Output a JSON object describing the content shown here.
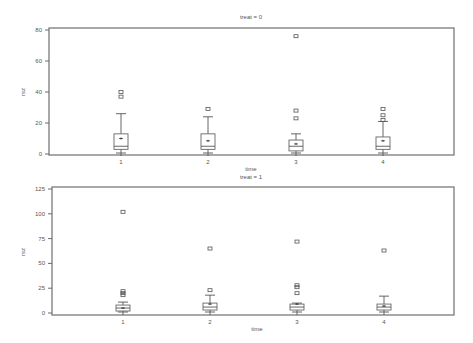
{
  "chart_data": [
    {
      "type": "boxplot",
      "title": "treat = 0",
      "xlabel": "time",
      "ylabel": "rsz",
      "categories": [
        "1",
        "2",
        "3",
        "4"
      ],
      "ylim": [
        0,
        80
      ],
      "yticks": [
        0,
        20,
        40,
        60,
        80
      ],
      "grid": false,
      "boxes": [
        {
          "category": "1",
          "whisker_low": 0,
          "q1": 3,
          "median": 5,
          "q3": 13,
          "whisker_high": 26,
          "mean": 10,
          "outliers": [
            37,
            40
          ]
        },
        {
          "category": "2",
          "whisker_low": 0,
          "q1": 3,
          "median": 5,
          "q3": 13,
          "whisker_high": 24,
          "mean": 8.5,
          "outliers": [
            29
          ]
        },
        {
          "category": "3",
          "whisker_low": 0,
          "q1": 2,
          "median": 5,
          "q3": 9,
          "whisker_high": 13,
          "mean": 6.5,
          "outliers": [
            23,
            28,
            76
          ]
        },
        {
          "category": "4",
          "whisker_low": 0,
          "q1": 3,
          "median": 5,
          "q3": 11,
          "whisker_high": 21,
          "mean": 8.5,
          "outliers": [
            22,
            25,
            29
          ]
        }
      ]
    },
    {
      "type": "boxplot",
      "title": "treat = 1",
      "xlabel": "time",
      "ylabel": "rsz",
      "categories": [
        "1",
        "2",
        "3",
        "4"
      ],
      "ylim": [
        0,
        125
      ],
      "yticks": [
        0,
        25,
        50,
        75,
        100,
        125
      ],
      "grid": false,
      "boxes": [
        {
          "category": "1",
          "whisker_low": 0,
          "q1": 2,
          "median": 5,
          "q3": 8,
          "whisker_high": 11,
          "mean": 5,
          "outliers": [
            18,
            20,
            22,
            102
          ]
        },
        {
          "category": "2",
          "whisker_low": 0,
          "q1": 3,
          "median": 6,
          "q3": 10,
          "whisker_high": 18,
          "mean": 9,
          "outliers": [
            23,
            65
          ]
        },
        {
          "category": "3",
          "whisker_low": 0,
          "q1": 3,
          "median": 6,
          "q3": 9,
          "whisker_high": 10,
          "mean": 9,
          "outliers": [
            20,
            26,
            28,
            72
          ]
        },
        {
          "category": "4",
          "whisker_low": 0,
          "q1": 3,
          "median": 6,
          "q3": 9,
          "whisker_high": 17,
          "mean": 7,
          "outliers": [
            63
          ]
        }
      ]
    }
  ]
}
